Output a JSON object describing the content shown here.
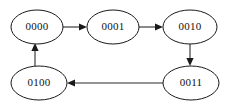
{
  "diagram": {
    "type": "state-transition-graph",
    "background_color": "#ffffff",
    "stroke_color": "#1a1a1a",
    "nodes": [
      {
        "id": "n0",
        "label": "0000",
        "cx": 37,
        "cy": 27,
        "rx": 26,
        "ry": 17
      },
      {
        "id": "n1",
        "label": "0001",
        "cx": 113,
        "cy": 27,
        "rx": 26,
        "ry": 17
      },
      {
        "id": "n2",
        "label": "0010",
        "cx": 190,
        "cy": 27,
        "rx": 27,
        "ry": 17
      },
      {
        "id": "n3",
        "label": "0100",
        "cx": 39,
        "cy": 83,
        "rx": 28,
        "ry": 17
      },
      {
        "id": "n4",
        "label": "0011",
        "cx": 191,
        "cy": 83,
        "rx": 28,
        "ry": 17
      }
    ],
    "edges": [
      {
        "id": "e0",
        "from": "0000",
        "to": "0001",
        "direction": "right"
      },
      {
        "id": "e1",
        "from": "0001",
        "to": "0010",
        "direction": "right"
      },
      {
        "id": "e2",
        "from": "0010",
        "to": "0011",
        "direction": "down"
      },
      {
        "id": "e3",
        "from": "0011",
        "to": "0100",
        "direction": "left"
      },
      {
        "id": "e4",
        "from": "0100",
        "to": "0000",
        "direction": "up"
      }
    ]
  }
}
